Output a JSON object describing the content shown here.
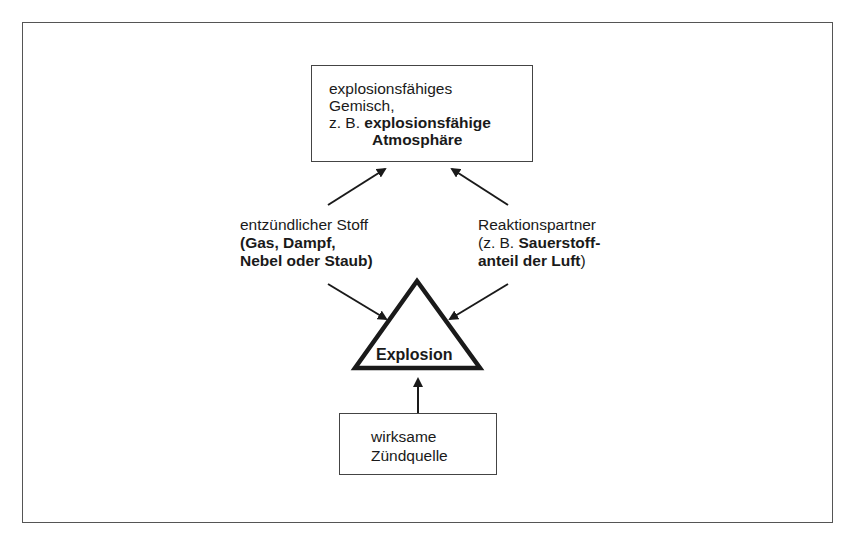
{
  "diagram": {
    "type": "explosion-triangle",
    "top_box": {
      "line1": "explosionsfähiges",
      "line2": "Gemisch,",
      "line3_prefix": "z. B. ",
      "line3_bold": "explosionsfähige",
      "line4_bold": "Atmosphäre"
    },
    "left_label": {
      "line1": "entzündlicher Stoff",
      "line2_bold": "(Gas, Dampf,",
      "line3_bold": "Nebel oder Staub)"
    },
    "right_label": {
      "line1": "Reaktionspartner",
      "line2_prefix": "(z. B. ",
      "line2_bold": "Sauerstoff-",
      "line3_bold": "anteil der Luft",
      "line3_suffix": ")"
    },
    "center": {
      "label": "Explosion"
    },
    "bottom_box": {
      "line1": "wirksame",
      "line2": "Zündquelle"
    },
    "colors": {
      "stroke": "#1a1a1a",
      "frame": "#555555",
      "background": "#ffffff"
    }
  }
}
